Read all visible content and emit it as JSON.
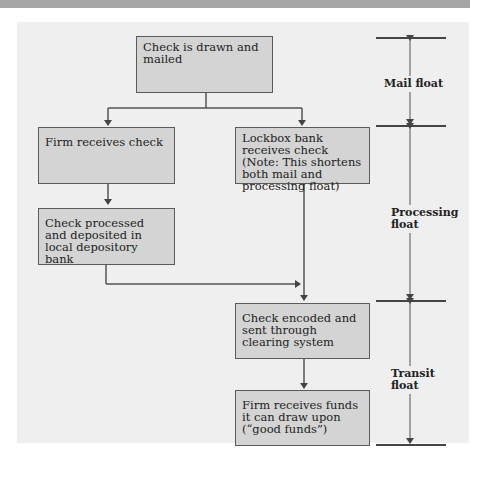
{
  "diagram": {
    "boxes": [
      {
        "id": "drawn",
        "text": "Check is drawn and mailed"
      },
      {
        "id": "firm_receives",
        "text": "Firm receives check"
      },
      {
        "id": "lockbox",
        "text": "Lockbox bank receives check (Note: This shortens both mail and processing float)"
      },
      {
        "id": "processed",
        "text": "Check processed and deposited in local depository bank"
      },
      {
        "id": "encoded",
        "text": "Check encoded and sent through clearing system"
      },
      {
        "id": "funds",
        "text": "Firm receives funds it can draw upon (“good funds”)"
      }
    ],
    "edges": [
      {
        "from": "drawn",
        "to": "firm_receives"
      },
      {
        "from": "drawn",
        "to": "lockbox"
      },
      {
        "from": "firm_receives",
        "to": "processed"
      },
      {
        "from": "processed",
        "to": "encoded"
      },
      {
        "from": "lockbox",
        "to": "encoded"
      },
      {
        "from": "encoded",
        "to": "funds"
      }
    ],
    "float_periods": [
      {
        "label": "Mail float"
      },
      {
        "label": "Processing float"
      },
      {
        "label": "Transit float"
      }
    ]
  }
}
